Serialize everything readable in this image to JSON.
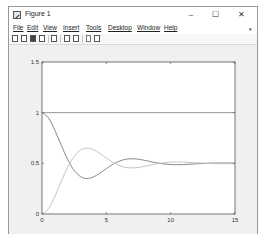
{
  "window": {
    "title": "Figure 1",
    "controls": {
      "minimize": "–",
      "maximize": "☐",
      "close": "✕"
    }
  },
  "menubar": {
    "items": [
      "File",
      "Edit",
      "View",
      "Insert",
      "Tools",
      "Desktop",
      "Window",
      "Help"
    ],
    "overflow_arrow": "▾"
  },
  "toolbar": {
    "buttons": [
      "new-figure",
      "open-file",
      "save",
      "print",
      "link-plot",
      "insert-colorbar",
      "insert-legend",
      "edit-plot",
      "open-property-inspector"
    ]
  },
  "colors": {
    "figure_bg": "#f0f0f0",
    "axes_bg": "#ffffff",
    "axis_line": "#555555",
    "series_dark": "#7a7a7a",
    "series_light": "#bdbdbd",
    "series_ref": "#8a8a8a"
  },
  "chart_data": {
    "type": "line",
    "title": "",
    "xlabel": "",
    "ylabel": "",
    "xlim": [
      0,
      15
    ],
    "ylim": [
      0,
      1.5
    ],
    "xticks": [
      0,
      5,
      10,
      15
    ],
    "xtick_labels": [
      "0",
      "5",
      "10",
      "15"
    ],
    "yticks": [
      0,
      0.5,
      1,
      1.5
    ],
    "ytick_labels": [
      "0",
      "0.5",
      "1",
      "1.5"
    ],
    "grid": false,
    "legend": null,
    "x": [
      0,
      0.5,
      1,
      1.5,
      2,
      2.5,
      3,
      3.5,
      4,
      4.5,
      5,
      5.5,
      6,
      6.5,
      7,
      7.5,
      8,
      9,
      10,
      11,
      12,
      13,
      14,
      15
    ],
    "series": [
      {
        "name": "reference (constant 1)",
        "color": "#8a8a8a",
        "values": [
          1,
          1,
          1,
          1,
          1,
          1,
          1,
          1,
          1,
          1,
          1,
          1,
          1,
          1,
          1,
          1,
          1,
          1,
          1,
          1,
          1,
          1,
          1,
          1
        ]
      },
      {
        "name": "decaying response (from 1)",
        "color": "#7a7a7a",
        "values": [
          1,
          0.949,
          0.826,
          0.677,
          0.537,
          0.43,
          0.369,
          0.35,
          0.366,
          0.403,
          0.448,
          0.49,
          0.521,
          0.54,
          0.545,
          0.54,
          0.529,
          0.503,
          0.488,
          0.488,
          0.495,
          0.502,
          0.504,
          0.503
        ]
      },
      {
        "name": "rising response (from 0)",
        "color": "#bdbdbd",
        "values": [
          0,
          0.051,
          0.174,
          0.323,
          0.463,
          0.57,
          0.631,
          0.65,
          0.634,
          0.597,
          0.552,
          0.51,
          0.479,
          0.46,
          0.455,
          0.46,
          0.471,
          0.497,
          0.512,
          0.512,
          0.505,
          0.498,
          0.496,
          0.497
        ]
      }
    ]
  }
}
